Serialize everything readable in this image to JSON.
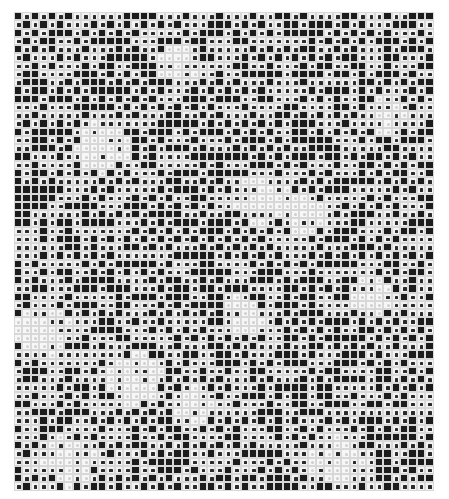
{
  "artwork": {
    "description": "Halftone checkered grid of small squares",
    "columns": 50,
    "rows": 58,
    "colors": {
      "dark": "#1c1c1c",
      "dot": "#2a2a2a",
      "light": "#f7f7f7",
      "grid_line": "#d8d8d8"
    },
    "legend": {
      "#": "dark square",
      "o": "white square with dark dot",
      ".": "light square"
    },
    "light_patches": [
      {
        "col": 10,
        "row": 16,
        "r": 3
      },
      {
        "col": 29,
        "row": 22,
        "r": 3
      },
      {
        "col": 34,
        "row": 24,
        "r": 2
      },
      {
        "col": 19,
        "row": 6,
        "r": 2
      },
      {
        "col": 3,
        "row": 38,
        "r": 3
      },
      {
        "col": 14,
        "row": 44,
        "r": 3
      },
      {
        "col": 21,
        "row": 47,
        "r": 2
      },
      {
        "col": 6,
        "row": 54,
        "r": 3
      },
      {
        "col": 38,
        "row": 54,
        "r": 3
      },
      {
        "col": 44,
        "row": 12,
        "r": 2
      },
      {
        "col": 42,
        "row": 34,
        "r": 2
      },
      {
        "col": 27,
        "row": 36,
        "r": 2
      }
    ]
  }
}
